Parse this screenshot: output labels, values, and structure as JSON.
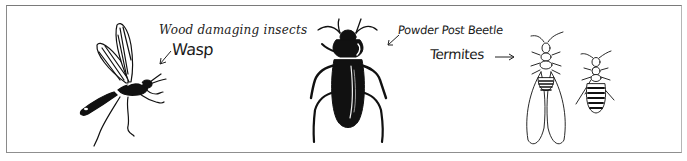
{
  "figure": {
    "title": "Wood damaging insects",
    "labels": {
      "wasp": "Wasp",
      "beetle": "Powder Post Beetle",
      "termites": "Termites"
    },
    "illustrations": [
      {
        "name": "wasp",
        "style": "black ink line drawing, winged"
      },
      {
        "name": "powder-post-beetle",
        "style": "solid black silhouette"
      },
      {
        "name": "termite-winged",
        "style": "line drawing with long wings"
      },
      {
        "name": "termite-worker",
        "style": "line drawing, striped abdomen"
      }
    ],
    "colors": {
      "ink": "#111111",
      "frame": "#8a8a8a",
      "background": "#ffffff"
    }
  }
}
